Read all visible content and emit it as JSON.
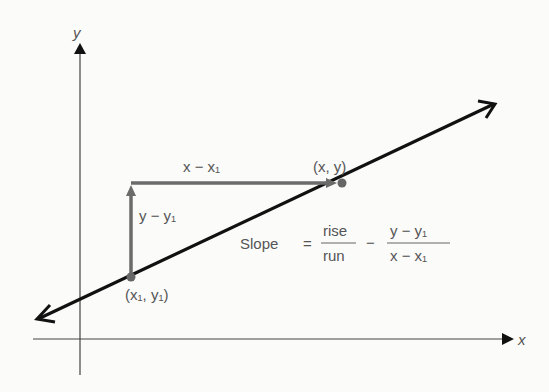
{
  "diagram": {
    "axes": {
      "x_label": "x",
      "y_label": "y"
    },
    "points": {
      "p1_label": "(x₁, y₁)",
      "p2_label": "(x, y)"
    },
    "run_label": "x − x₁",
    "rise_label": "y − y₁",
    "formula": {
      "lhs": "Slope",
      "eq": "=",
      "num1": "rise",
      "den1": "run",
      "eq2": "−",
      "num2": "y − y₁",
      "den2": "x − x₁"
    },
    "colors": {
      "line": "#111111",
      "axes": "#333333",
      "rise_run": "#6b6b6b",
      "text": "#555555",
      "background": "#fbfbfa"
    }
  }
}
